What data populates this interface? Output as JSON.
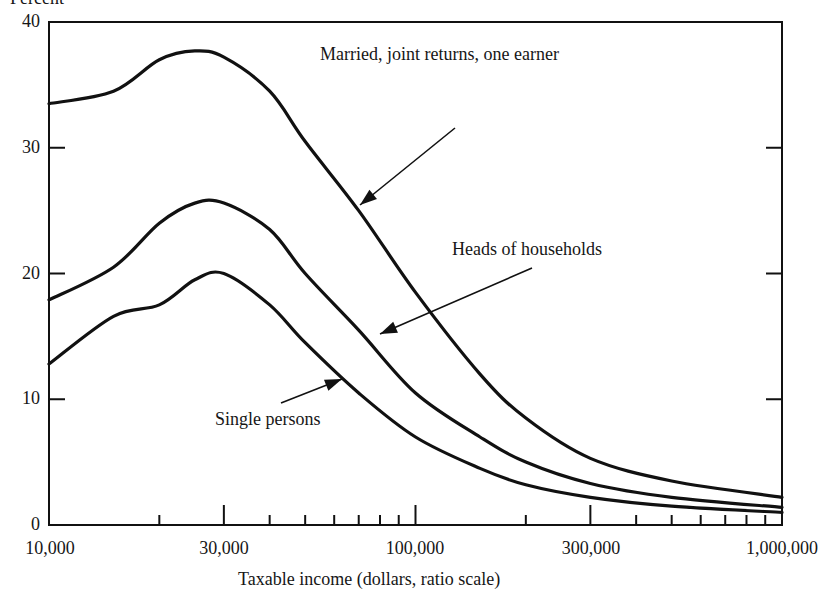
{
  "chart_data": {
    "type": "line",
    "title": "",
    "ylabel": "Percent",
    "xlabel": "Taxable income (dollars, ratio scale)",
    "x_scale": "log",
    "xlim": [
      10000,
      1000000
    ],
    "ylim": [
      0,
      40
    ],
    "grid": false,
    "legend": "inline annotations with arrows",
    "x_ticks": [
      10000,
      20000,
      30000,
      40000,
      50000,
      60000,
      70000,
      80000,
      90000,
      100000,
      200000,
      300000,
      400000,
      500000,
      600000,
      700000,
      800000,
      900000,
      1000000
    ],
    "x_tick_labels": [
      "10,000",
      "30,000",
      "100,000",
      "300,000",
      "1,000,000"
    ],
    "y_tick_labels": [
      "0",
      "10",
      "20",
      "30",
      "40"
    ],
    "x": [
      10000,
      15000,
      20000,
      25000,
      30000,
      40000,
      50000,
      70000,
      100000,
      150000,
      200000,
      300000,
      500000,
      1000000
    ],
    "series": [
      {
        "name": "Married, joint returns, one earner",
        "values": [
          33.5,
          34.5,
          37.0,
          37.7,
          37.2,
          34.5,
          30.5,
          25.0,
          18.5,
          12.0,
          8.5,
          5.3,
          3.5,
          2.2
        ]
      },
      {
        "name": "Heads of households",
        "values": [
          17.9,
          20.5,
          24.0,
          25.6,
          25.6,
          23.5,
          20.0,
          15.5,
          10.5,
          7.0,
          5.0,
          3.3,
          2.2,
          1.4
        ]
      },
      {
        "name": "Single persons",
        "values": [
          12.8,
          16.6,
          17.5,
          19.5,
          20.0,
          17.5,
          14.5,
          10.5,
          7.0,
          4.5,
          3.2,
          2.2,
          1.5,
          1.0
        ]
      }
    ],
    "annotations": [
      {
        "text": "Married, joint returns, one earner",
        "target_series": 0
      },
      {
        "text": "Heads of households",
        "target_series": 1
      },
      {
        "text": "Single persons",
        "target_series": 2
      }
    ]
  },
  "labels": {
    "ylabel": "Percent",
    "xlabel": "Taxable income (dollars, ratio scale)",
    "yticks": [
      "0",
      "10",
      "20",
      "30",
      "40"
    ],
    "xticks": [
      "10,000",
      "30,000",
      "100,000",
      "300,000",
      "1,000,000"
    ],
    "annot_married": "Married, joint returns, one earner",
    "annot_heads": "Heads of households",
    "annot_single": "Single persons"
  },
  "style": {
    "line_color": "#111111",
    "axis_color": "#111111",
    "background": "#ffffff"
  }
}
